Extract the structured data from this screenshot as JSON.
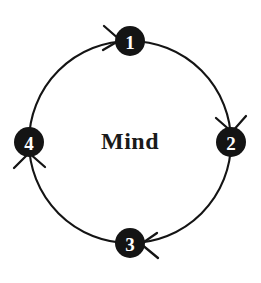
{
  "diagram": {
    "title": "Mind",
    "center_label": "Mind",
    "type": "cyclical-process-diagram",
    "direction": "clockwise",
    "background_color": "#ffffff",
    "stroke_color": "#141414",
    "node_fill_color": "#141414",
    "node_text_color": "#ffffff",
    "center_text_color": "#1a1a1a",
    "geometry": {
      "center_x": 130,
      "center_y": 142,
      "ring_radius": 101,
      "node_radius": 14
    },
    "nodes": [
      {
        "id": "node-1",
        "label": "1",
        "position": "top",
        "cx": 130,
        "cy": 41
      },
      {
        "id": "node-2",
        "label": "2",
        "position": "right",
        "cx": 231,
        "cy": 142
      },
      {
        "id": "node-3",
        "label": "3",
        "position": "bottom",
        "cx": 130,
        "cy": 243
      },
      {
        "id": "node-4",
        "label": "4",
        "position": "left",
        "cx": 29,
        "cy": 142
      }
    ],
    "edges": [
      {
        "id": "edge-4-to-1",
        "from": "4",
        "to": "1",
        "arrow_at": "node-1",
        "arrow_direction": "right"
      },
      {
        "id": "edge-1-to-2",
        "from": "1",
        "to": "2",
        "arrow_at": "node-2",
        "arrow_direction": "down"
      },
      {
        "id": "edge-2-to-3",
        "from": "2",
        "to": "3",
        "arrow_at": "node-3",
        "arrow_direction": "left"
      },
      {
        "id": "edge-3-to-4",
        "from": "3",
        "to": "4",
        "arrow_at": "node-4",
        "arrow_direction": "up"
      }
    ]
  }
}
